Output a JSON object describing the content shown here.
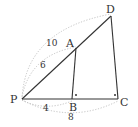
{
  "diagram": {
    "points": {
      "P": {
        "label": "P",
        "x": 22,
        "y": 99
      },
      "A": {
        "label": "A",
        "x": 76,
        "y": 48
      },
      "B": {
        "label": "B",
        "x": 72,
        "y": 99
      },
      "C": {
        "label": "C",
        "x": 118,
        "y": 99
      },
      "D": {
        "label": "D",
        "x": 111,
        "y": 16
      }
    },
    "segments": [
      [
        "P",
        "D"
      ],
      [
        "P",
        "C"
      ],
      [
        "A",
        "B"
      ],
      [
        "D",
        "C"
      ]
    ],
    "right_angle_marks": [
      "B",
      "C"
    ],
    "lengths": {
      "PA": "6",
      "PD": "10",
      "PB": "4",
      "PC": "8"
    },
    "colors": {
      "line": "#333333",
      "dotted": "#bbbbbb"
    }
  }
}
